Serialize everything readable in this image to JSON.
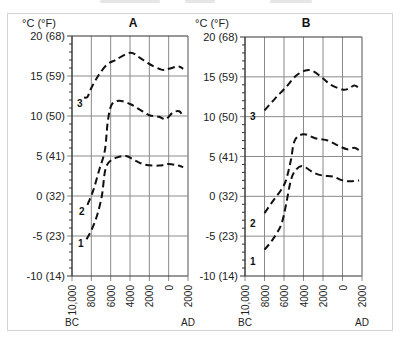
{
  "chart_data": [
    {
      "type": "line",
      "title": "A",
      "ylabel": "°C (°F)",
      "xlabel": "",
      "x_unit_left": "BC",
      "x_unit_right": "AD",
      "x": [
        -10000,
        -8000,
        -6000,
        -4000,
        -2000,
        0,
        2000
      ],
      "x_tick_labels": [
        "10,000",
        "8000",
        "6000",
        "4000",
        "2000",
        "0",
        "2000"
      ],
      "y_tick_values": [
        20,
        15,
        10,
        5,
        0,
        -5,
        -10
      ],
      "y_tick_labels": [
        "20 (68)",
        "15 (59)",
        "10 (50)",
        "5  (41)",
        "0 (32)",
        "-5 (23)",
        "-10 (14)"
      ],
      "xlim": [
        -10000,
        2000
      ],
      "ylim": [
        -10,
        20
      ],
      "grid": true,
      "series": [
        {
          "name": "3",
          "points": [
            [
              -8750,
              12.3
            ],
            [
              -8400,
              12.4
            ],
            [
              -8000,
              13.5
            ],
            [
              -7300,
              15
            ],
            [
              -6400,
              16.4
            ],
            [
              -5500,
              17
            ],
            [
              -4000,
              17.9
            ],
            [
              -3000,
              17.3
            ],
            [
              -2000,
              16.5
            ],
            [
              -750,
              15.8
            ],
            [
              0,
              15.9
            ],
            [
              1000,
              16.2
            ],
            [
              1500,
              15.9
            ]
          ]
        },
        {
          "name": "2",
          "points": [
            [
              -8400,
              -1.1
            ],
            [
              -7800,
              0.7
            ],
            [
              -7200,
              3.2
            ],
            [
              -6600,
              5.7
            ],
            [
              -6300,
              9.3
            ],
            [
              -5900,
              11.4
            ],
            [
              -5100,
              11.9
            ],
            [
              -4000,
              11.5
            ],
            [
              -3000,
              10.8
            ],
            [
              -2000,
              10.1
            ],
            [
              -1000,
              9.9
            ],
            [
              -300,
              9.6
            ],
            [
              400,
              10.4
            ],
            [
              1100,
              10.6
            ],
            [
              1500,
              9.9
            ]
          ]
        },
        {
          "name": "1",
          "points": [
            [
              -8500,
              -5.4
            ],
            [
              -8000,
              -4.3
            ],
            [
              -7400,
              -2.4
            ],
            [
              -6900,
              0.1
            ],
            [
              -6600,
              3
            ],
            [
              -6200,
              4.2
            ],
            [
              -5400,
              4.8
            ],
            [
              -4400,
              5
            ],
            [
              -3400,
              4.4
            ],
            [
              -2400,
              3.9
            ],
            [
              -1000,
              3.8
            ],
            [
              0,
              4
            ],
            [
              1000,
              3.8
            ],
            [
              1500,
              3.6
            ]
          ]
        }
      ],
      "series_labels": [
        {
          "name": "3",
          "at": [
            -9200,
            11.6
          ]
        },
        {
          "name": "2",
          "at": [
            -9000,
            -1.9
          ]
        },
        {
          "name": "1",
          "at": [
            -9100,
            -5.9
          ]
        }
      ]
    },
    {
      "type": "line",
      "title": "B",
      "ylabel": "°C (°F)",
      "xlabel": "",
      "x_unit_left": "BC",
      "x_unit_right": "AD",
      "x": [
        -10000,
        -8000,
        -6000,
        -4000,
        -2000,
        0,
        2000
      ],
      "x_tick_labels": [
        "10,000",
        "8000",
        "6000",
        "4000",
        "2000",
        "0",
        "2000"
      ],
      "y_tick_values": [
        20,
        15,
        10,
        5,
        0,
        -5,
        -10
      ],
      "y_tick_labels": [
        "20 (68)",
        "15 (59)",
        "10 (50)",
        "5  (41)",
        "0 (32)",
        "-5 (23)",
        "-10 (14)"
      ],
      "xlim": [
        -10000,
        2000
      ],
      "ylim": [
        -10,
        20
      ],
      "grid": true,
      "series": [
        {
          "name": "3",
          "points": [
            [
              -8000,
              10.8
            ],
            [
              -6900,
              12.3
            ],
            [
              -5800,
              13.7
            ],
            [
              -4800,
              15.1
            ],
            [
              -3800,
              15.8
            ],
            [
              -3000,
              15.7
            ],
            [
              -2000,
              14.8
            ],
            [
              -1200,
              14
            ],
            [
              0,
              13.4
            ],
            [
              600,
              13.5
            ],
            [
              1200,
              13.9
            ],
            [
              1700,
              13.6
            ]
          ]
        },
        {
          "name": "2",
          "points": [
            [
              -8000,
              -2.1
            ],
            [
              -7200,
              -0.7
            ],
            [
              -6300,
              0.8
            ],
            [
              -5800,
              2
            ],
            [
              -5300,
              4.5
            ],
            [
              -4900,
              7
            ],
            [
              -4000,
              7.8
            ],
            [
              -2800,
              7.3
            ],
            [
              -1500,
              7
            ],
            [
              -500,
              6.4
            ],
            [
              500,
              5.9
            ],
            [
              1200,
              6.1
            ],
            [
              1700,
              5.8
            ]
          ]
        },
        {
          "name": "1",
          "points": [
            [
              -8000,
              -6.7
            ],
            [
              -7200,
              -5.5
            ],
            [
              -6300,
              -3.6
            ],
            [
              -5800,
              -1.1
            ],
            [
              -5300,
              2
            ],
            [
              -4800,
              3.3
            ],
            [
              -4100,
              3.8
            ],
            [
              -3000,
              3
            ],
            [
              -2000,
              2.6
            ],
            [
              -1000,
              2.5
            ],
            [
              0,
              2
            ],
            [
              800,
              1.9
            ],
            [
              1700,
              2
            ]
          ]
        }
      ],
      "series_labels": [
        {
          "name": "3",
          "at": [
            -9200,
            10.1
          ]
        },
        {
          "name": "2",
          "at": [
            -9200,
            -3.3
          ]
        },
        {
          "name": "1",
          "at": [
            -9200,
            -8.1
          ]
        }
      ]
    }
  ],
  "panels": [
    {
      "title": "A",
      "unit": "°C (°F)",
      "era_left": "BC",
      "era_right": "AD"
    },
    {
      "title": "B",
      "unit": "°C (°F)",
      "era_left": "BC",
      "era_right": "AD"
    }
  ],
  "colors": {
    "curve": "#111111",
    "grid": "#8a8a8a",
    "axis": "#333333",
    "frame": "#d4d4d4"
  }
}
